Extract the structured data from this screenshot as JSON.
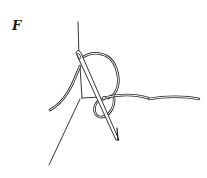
{
  "figure": {
    "label": "F",
    "colors": {
      "background": "#ffffff",
      "ink": "#1e1e1e"
    }
  }
}
